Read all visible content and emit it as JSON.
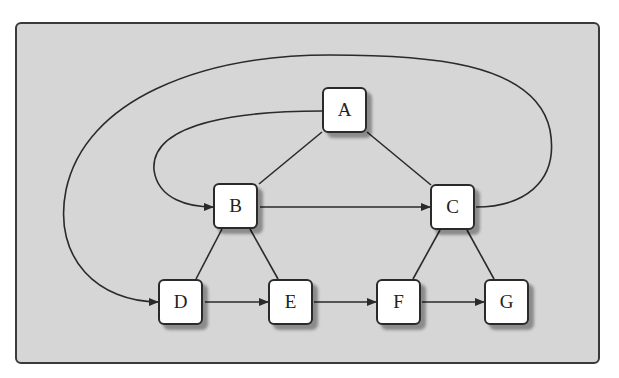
{
  "diagram": {
    "nodes": [
      {
        "id": "A",
        "label": "A",
        "x": 322,
        "y": 87
      },
      {
        "id": "B",
        "label": "B",
        "x": 213,
        "y": 183
      },
      {
        "id": "C",
        "label": "C",
        "x": 430,
        "y": 184
      },
      {
        "id": "D",
        "label": "D",
        "x": 158,
        "y": 279
      },
      {
        "id": "E",
        "label": "E",
        "x": 268,
        "y": 279
      },
      {
        "id": "F",
        "label": "F",
        "x": 376,
        "y": 279
      },
      {
        "id": "G",
        "label": "G",
        "x": 484,
        "y": 279
      }
    ],
    "edges": [
      {
        "from": "A",
        "to": "B",
        "type": "undirected"
      },
      {
        "from": "A",
        "to": "C",
        "type": "undirected"
      },
      {
        "from": "B",
        "to": "D",
        "type": "undirected"
      },
      {
        "from": "B",
        "to": "E",
        "type": "undirected"
      },
      {
        "from": "C",
        "to": "F",
        "type": "undirected"
      },
      {
        "from": "C",
        "to": "G",
        "type": "undirected"
      },
      {
        "from": "B",
        "to": "C",
        "type": "directed"
      },
      {
        "from": "D",
        "to": "E",
        "type": "directed"
      },
      {
        "from": "E",
        "to": "F",
        "type": "directed"
      },
      {
        "from": "F",
        "to": "G",
        "type": "directed"
      },
      {
        "from": "A",
        "to": "B",
        "type": "directed-curve"
      },
      {
        "from": "C",
        "to": "D",
        "type": "directed-curve"
      }
    ],
    "colors": {
      "background": "#d6d6d6",
      "node_fill": "#ffffff",
      "stroke": "#2a2a2a"
    }
  }
}
